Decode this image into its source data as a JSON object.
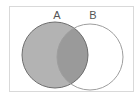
{
  "diagram": {
    "type": "venn",
    "sets": [
      {
        "label": "A",
        "shaded": true
      },
      {
        "label": "B",
        "shaded": false
      }
    ],
    "regions": {
      "a_only": "shaded",
      "a_and_b": "shaded-darker",
      "b_only": "unshaded"
    },
    "colors": {
      "frame": "#d9d9d9",
      "a_fill": "#b3b3b3",
      "intersection_fill": "#9a9a9a",
      "a_stroke": "#6e6e6e",
      "b_stroke": "#9e9e9e",
      "label": "#555555"
    }
  }
}
